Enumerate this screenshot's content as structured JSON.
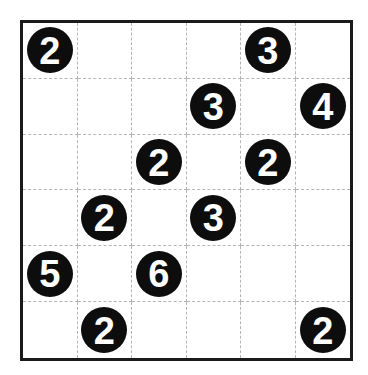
{
  "puzzle": {
    "rows": 6,
    "cols": 6,
    "colors": {
      "clue_fill": "#0d0d0d",
      "clue_text": "#ffffff",
      "border": "#1a1a1a",
      "grid_line": "#b5b5b5",
      "background": "#ffffff"
    },
    "grid": [
      [
        "2",
        "",
        "",
        "",
        "3",
        ""
      ],
      [
        "",
        "",
        "",
        "3",
        "",
        "4"
      ],
      [
        "",
        "",
        "2",
        "",
        "2",
        ""
      ],
      [
        "",
        "2",
        "",
        "3",
        "",
        ""
      ],
      [
        "5",
        "",
        "6",
        "",
        "",
        ""
      ],
      [
        "",
        "2",
        "",
        "",
        "",
        "2"
      ]
    ]
  }
}
